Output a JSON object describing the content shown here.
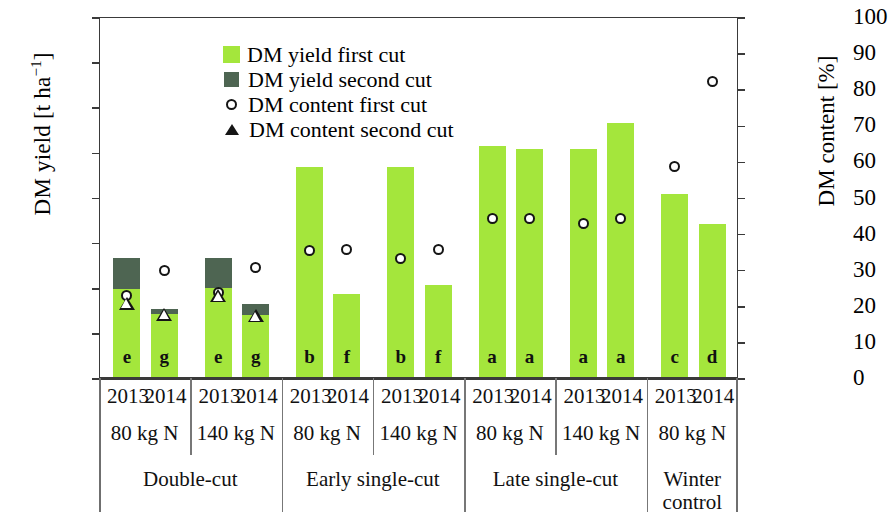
{
  "axes": {
    "left_title_main": "DM yield [t ha",
    "left_title_sup": "−1",
    "left_title_close": "]",
    "right_title": "DM content [%]",
    "left_ticks": [
      "0",
      "5",
      "10",
      "15",
      "20",
      "25",
      "30",
      "35",
      "40"
    ],
    "right_ticks": [
      "0",
      "10",
      "20",
      "30",
      "40",
      "50",
      "60",
      "70",
      "80",
      "90",
      "100"
    ],
    "left_min": 0,
    "left_max": 40,
    "right_min": 0,
    "right_max": 100
  },
  "legend": {
    "items": [
      {
        "label": "DM yield first cut",
        "marker": "square",
        "color": "#a4e63c",
        "icon": "light-green-square-icon"
      },
      {
        "label": "DM yield second cut",
        "marker": "square",
        "color": "#4e6552",
        "icon": "dark-green-square-icon"
      },
      {
        "label": "DM content first cut",
        "marker": "circle",
        "color": "#151515",
        "icon": "open-circle-icon"
      },
      {
        "label": "DM content second cut",
        "marker": "triangle",
        "color": "#151515",
        "icon": "open-triangle-icon"
      }
    ]
  },
  "category_rows": {
    "years": [
      "2013",
      "2014",
      "2013",
      "2014",
      "2013",
      "2014",
      "2013",
      "2014",
      "2013",
      "2014",
      "2013",
      "2014",
      "2013",
      "2014"
    ],
    "nitrogen": [
      "80 kg N",
      "140 kg N",
      "80 kg N",
      "140 kg N",
      "80 kg N",
      "140 kg N",
      "80 kg N"
    ],
    "systems": [
      "Double-cut",
      "Early single-cut",
      "Late single-cut",
      "Winter control"
    ]
  },
  "chart_data": {
    "type": "bar",
    "title": "",
    "xlabel": "",
    "ylabel": "DM yield [t ha−1]",
    "y2label": "DM content [%]",
    "ylim": [
      0,
      40
    ],
    "y2lim": [
      0,
      100
    ],
    "grid": false,
    "legend_position": "top-left",
    "categories": [
      "Double-cut 80 kg N 2013",
      "Double-cut 80 kg N 2014",
      "Double-cut 140 kg N 2013",
      "Double-cut 140 kg N 2014",
      "Early single-cut 80 kg N 2013",
      "Early single-cut 80 kg N 2014",
      "Early single-cut 140 kg N 2013",
      "Early single-cut 140 kg N 2014",
      "Late single-cut 80 kg N 2013",
      "Late single-cut 80 kg N 2014",
      "Late single-cut 140 kg N 2013",
      "Late single-cut 140 kg N 2014",
      "Winter control 80 kg N 2013",
      "Winter control 80 kg N 2014"
    ],
    "series": [
      {
        "name": "DM yield first cut",
        "axis": "left",
        "unit": "t ha-1",
        "color": "#a4e63c",
        "values": [
          9.8,
          7.0,
          9.9,
          6.9,
          23.3,
          9.2,
          23.3,
          10.2,
          25.6,
          25.3,
          25.3,
          28.1,
          20.3,
          17.0
        ]
      },
      {
        "name": "DM yield second cut",
        "axis": "left",
        "unit": "t ha-1",
        "color": "#4e6552",
        "values": [
          3.4,
          0.5,
          3.3,
          1.2,
          null,
          null,
          null,
          null,
          null,
          null,
          null,
          null,
          null,
          null
        ]
      },
      {
        "name": "DM content first cut",
        "axis": "right",
        "unit": "%",
        "marker": "open-circle",
        "values": [
          23.0,
          30.0,
          24.0,
          31.0,
          35.5,
          36.0,
          33.5,
          36.0,
          44.5,
          44.5,
          43.0,
          44.5,
          59.0,
          82.5
        ]
      },
      {
        "name": "DM content second cut",
        "axis": "right",
        "unit": "%",
        "marker": "open-triangle",
        "values": [
          21.0,
          18.0,
          23.0,
          17.5,
          null,
          null,
          null,
          null,
          null,
          null,
          null,
          null,
          null,
          null
        ]
      }
    ],
    "significance_letters": [
      "e",
      "g",
      "e",
      "g",
      "b",
      "f",
      "b",
      "f",
      "a",
      "a",
      "a",
      "a",
      "c",
      "d"
    ]
  }
}
